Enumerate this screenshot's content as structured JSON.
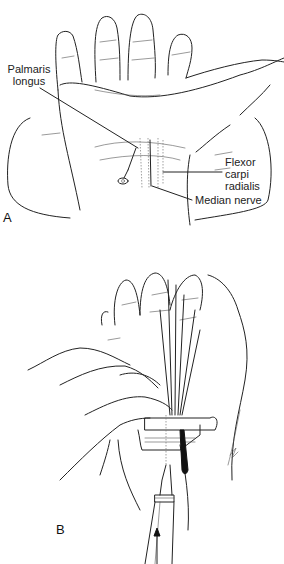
{
  "figure": {
    "panels": [
      {
        "id": "A",
        "letter": "A",
        "labels": {
          "palmaris_longus": "Palmaris longus",
          "palmaris_line1": "Palmaris",
          "palmaris_line2": "longus",
          "flexor_line1": "Flexor",
          "flexor_line2": "carpi",
          "flexor_line3": "radialis",
          "median_nerve": "Median nerve"
        }
      },
      {
        "id": "B",
        "letter": "B"
      }
    ],
    "colors": {
      "line": "#222222",
      "background": "#ffffff"
    }
  }
}
